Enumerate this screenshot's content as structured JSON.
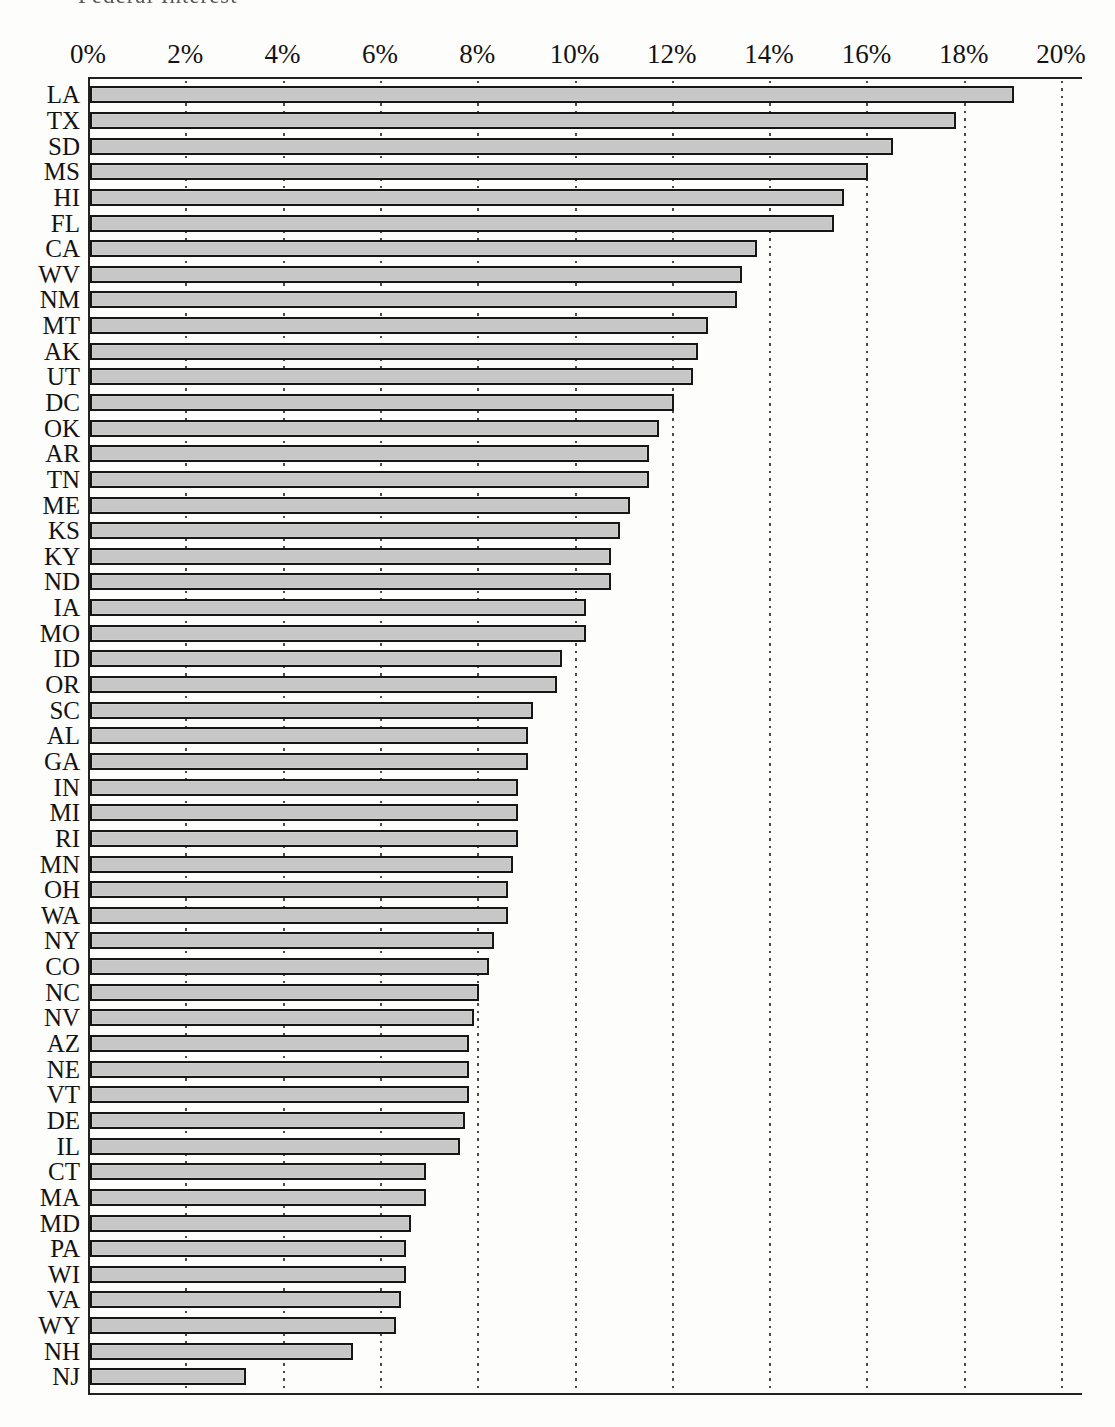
{
  "header": {
    "fragment": "Federal Interest"
  },
  "chart_data": {
    "type": "bar",
    "orientation": "horizontal",
    "title": "",
    "xlabel": "",
    "ylabel": "",
    "axis_position": "top",
    "xlim": [
      0,
      20
    ],
    "grid": "dotted-vertical-every-2pct",
    "bar_fill_color": "#c7c7c7",
    "bar_border_color": "#161616",
    "x_tick_labels": [
      "0%",
      "2%",
      "4%",
      "6%",
      "8%",
      "10%",
      "12%",
      "14%",
      "16%",
      "18%",
      "20%"
    ],
    "x_tick_values": [
      0,
      2,
      4,
      6,
      8,
      10,
      12,
      14,
      16,
      18,
      20
    ],
    "categories": [
      "LA",
      "TX",
      "SD",
      "MS",
      "HI",
      "FL",
      "CA",
      "WV",
      "NM",
      "MT",
      "AK",
      "UT",
      "DC",
      "OK",
      "AR",
      "TN",
      "ME",
      "KS",
      "KY",
      "ND",
      "IA",
      "MO",
      "ID",
      "OR",
      "SC",
      "AL",
      "GA",
      "IN",
      "MI",
      "RI",
      "MN",
      "OH",
      "WA",
      "NY",
      "CO",
      "NC",
      "NV",
      "AZ",
      "NE",
      "VT",
      "DE",
      "IL",
      "CT",
      "MA",
      "MD",
      "PA",
      "WI",
      "VA",
      "WY",
      "NH",
      "NJ"
    ],
    "values": [
      19.0,
      17.8,
      16.5,
      16.0,
      15.5,
      15.3,
      13.7,
      13.4,
      13.3,
      12.7,
      12.5,
      12.4,
      12.0,
      11.7,
      11.5,
      11.5,
      11.1,
      10.9,
      10.7,
      10.7,
      10.2,
      10.2,
      9.7,
      9.6,
      9.1,
      9.0,
      9.0,
      8.8,
      8.8,
      8.8,
      8.7,
      8.6,
      8.6,
      8.3,
      8.2,
      8.0,
      7.9,
      7.8,
      7.8,
      7.8,
      7.7,
      7.6,
      6.9,
      6.9,
      6.6,
      6.5,
      6.5,
      6.4,
      6.3,
      5.4,
      3.2
    ]
  }
}
